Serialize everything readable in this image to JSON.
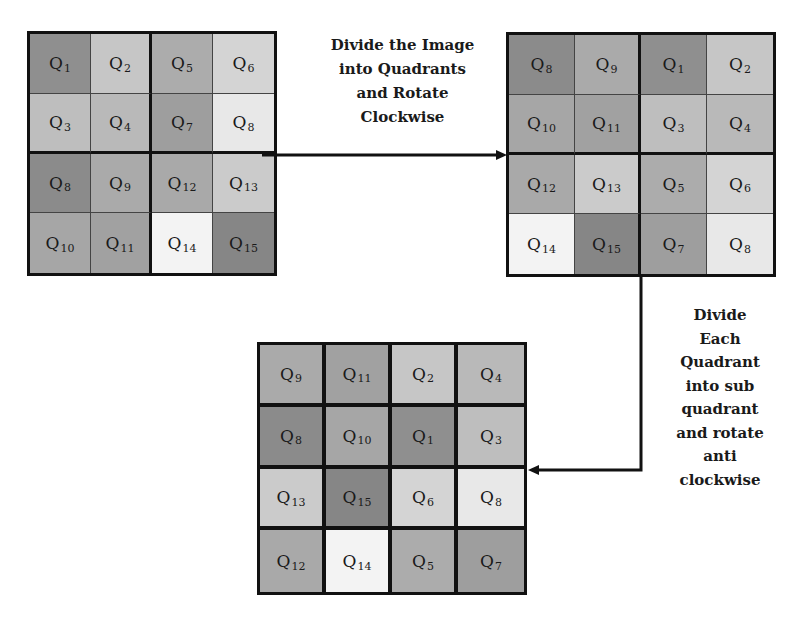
{
  "diagram": {
    "step1_label": [
      "Divide the Image",
      "into Quadrants",
      "and Rotate",
      "Clockwise"
    ],
    "step2_label": [
      "Divide",
      "Each",
      "Quadrant",
      "into sub",
      "quadrant",
      "and rotate",
      "anti",
      "clockwise"
    ],
    "grids": [
      {
        "name": "original-image-grid",
        "cells": [
          [
            {
              "q": "Q",
              "n": "1",
              "color": "#8f8f8f"
            },
            {
              "q": "Q",
              "n": "2",
              "color": "#c6c6c6"
            },
            {
              "q": "Q",
              "n": "5",
              "color": "#acacac"
            },
            {
              "q": "Q",
              "n": "6",
              "color": "#d4d4d4"
            }
          ],
          [
            {
              "q": "Q",
              "n": "3",
              "color": "#bebebe"
            },
            {
              "q": "Q",
              "n": "4",
              "color": "#b9b9b9"
            },
            {
              "q": "Q",
              "n": "7",
              "color": "#9e9e9e"
            },
            {
              "q": "Q",
              "n": "8",
              "color": "#e8e8e8"
            }
          ],
          [
            {
              "q": "Q",
              "n": "8",
              "color": "#8b8b8b"
            },
            {
              "q": "Q",
              "n": "9",
              "color": "#aaaaaa"
            },
            {
              "q": "Q",
              "n": "12",
              "color": "#a9a9a9"
            },
            {
              "q": "Q",
              "n": "13",
              "color": "#cbcbcb"
            }
          ],
          [
            {
              "q": "Q",
              "n": "10",
              "color": "#a6a6a6"
            },
            {
              "q": "Q",
              "n": "11",
              "color": "#a1a1a1"
            },
            {
              "q": "Q",
              "n": "14",
              "color": "#f3f3f3"
            },
            {
              "q": "Q",
              "n": "15",
              "color": "#868686"
            }
          ]
        ]
      },
      {
        "name": "quadrant-rotated-grid",
        "cells": [
          [
            {
              "q": "Q",
              "n": "8",
              "color": "#8b8b8b"
            },
            {
              "q": "Q",
              "n": "9",
              "color": "#aaaaaa"
            },
            {
              "q": "Q",
              "n": "1",
              "color": "#8f8f8f"
            },
            {
              "q": "Q",
              "n": "2",
              "color": "#c6c6c6"
            }
          ],
          [
            {
              "q": "Q",
              "n": "10",
              "color": "#a6a6a6"
            },
            {
              "q": "Q",
              "n": "11",
              "color": "#a1a1a1"
            },
            {
              "q": "Q",
              "n": "3",
              "color": "#bebebe"
            },
            {
              "q": "Q",
              "n": "4",
              "color": "#b9b9b9"
            }
          ],
          [
            {
              "q": "Q",
              "n": "12",
              "color": "#a9a9a9"
            },
            {
              "q": "Q",
              "n": "13",
              "color": "#cbcbcb"
            },
            {
              "q": "Q",
              "n": "5",
              "color": "#acacac"
            },
            {
              "q": "Q",
              "n": "6",
              "color": "#d4d4d4"
            }
          ],
          [
            {
              "q": "Q",
              "n": "14",
              "color": "#f3f3f3"
            },
            {
              "q": "Q",
              "n": "15",
              "color": "#868686"
            },
            {
              "q": "Q",
              "n": "7",
              "color": "#9e9e9e"
            },
            {
              "q": "Q",
              "n": "8",
              "color": "#e8e8e8"
            }
          ]
        ]
      },
      {
        "name": "sub-quadrant-rotated-grid",
        "cells": [
          [
            {
              "q": "Q",
              "n": "9",
              "color": "#aaaaaa"
            },
            {
              "q": "Q",
              "n": "11",
              "color": "#a1a1a1"
            },
            {
              "q": "Q",
              "n": "2",
              "color": "#c6c6c6"
            },
            {
              "q": "Q",
              "n": "4",
              "color": "#b9b9b9"
            }
          ],
          [
            {
              "q": "Q",
              "n": "8",
              "color": "#8b8b8b"
            },
            {
              "q": "Q",
              "n": "10",
              "color": "#a6a6a6"
            },
            {
              "q": "Q",
              "n": "1",
              "color": "#8f8f8f"
            },
            {
              "q": "Q",
              "n": "3",
              "color": "#bebebe"
            }
          ],
          [
            {
              "q": "Q",
              "n": "13",
              "color": "#cbcbcb"
            },
            {
              "q": "Q",
              "n": "15",
              "color": "#868686"
            },
            {
              "q": "Q",
              "n": "6",
              "color": "#d4d4d4"
            },
            {
              "q": "Q",
              "n": "8",
              "color": "#e8e8e8"
            }
          ],
          [
            {
              "q": "Q",
              "n": "12",
              "color": "#a9a9a9"
            },
            {
              "q": "Q",
              "n": "14",
              "color": "#f3f3f3"
            },
            {
              "q": "Q",
              "n": "5",
              "color": "#acacac"
            },
            {
              "q": "Q",
              "n": "7",
              "color": "#9e9e9e"
            }
          ]
        ]
      }
    ]
  }
}
